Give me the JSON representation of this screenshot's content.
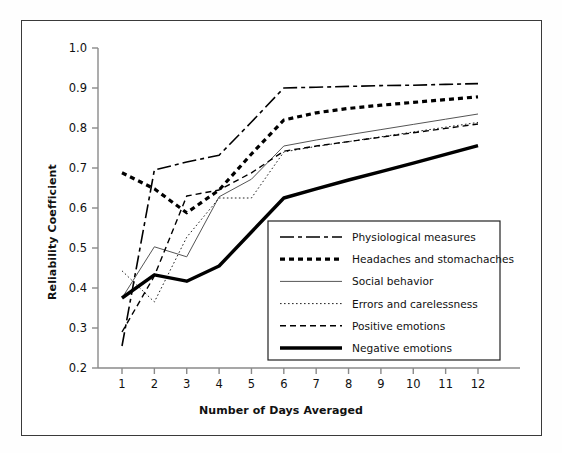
{
  "chart_data": {
    "type": "line",
    "title": "",
    "xlabel": "Number of Days Averaged",
    "ylabel": "Reliability Coefficient",
    "x": [
      1,
      2,
      3,
      4,
      5,
      6,
      7,
      8,
      9,
      10,
      11,
      12
    ],
    "xlim": [
      0.7,
      12.6
    ],
    "ylim": [
      0.2,
      1.0
    ],
    "xticks": [
      "1",
      "2",
      "3",
      "4",
      "5",
      "6",
      "7",
      "8",
      "9",
      "10",
      "11",
      "12"
    ],
    "yticks": [
      "0.2",
      "0.3",
      "0.4",
      "0.5",
      "0.6",
      "0.7",
      "0.8",
      "0.9",
      "1.0"
    ],
    "grid": false,
    "legend_position": "lower right",
    "series": [
      {
        "name": "Physiological measures",
        "style": "dash-dot",
        "width": 1.6,
        "color": "#000000",
        "values": [
          0.255,
          0.695,
          0.715,
          0.732,
          0.815,
          0.9,
          0.902,
          0.904,
          0.906,
          0.907,
          0.909,
          0.911
        ]
      },
      {
        "name": "Headaches and stomachaches",
        "style": "thick-dotted",
        "width": 3.2,
        "color": "#000000",
        "values": [
          0.688,
          0.648,
          0.588,
          0.645,
          0.735,
          0.82,
          0.838,
          0.849,
          0.857,
          0.864,
          0.871,
          0.878
        ]
      },
      {
        "name": "Social behavior",
        "style": "solid-thin",
        "width": 1.0,
        "color": "#555555",
        "values": [
          0.375,
          0.503,
          0.478,
          0.628,
          0.672,
          0.755,
          0.77,
          0.783,
          0.796,
          0.809,
          0.822,
          0.835
        ]
      },
      {
        "name": "Errors and carelessness",
        "style": "fine-dotted",
        "width": 1.0,
        "color": "#222222",
        "values": [
          0.443,
          0.365,
          0.527,
          0.625,
          0.625,
          0.74,
          0.754,
          0.766,
          0.778,
          0.79,
          0.802,
          0.814
        ]
      },
      {
        "name": "Positive emotions",
        "style": "dashed",
        "width": 1.4,
        "color": "#000000",
        "values": [
          0.29,
          0.43,
          0.63,
          0.645,
          0.688,
          0.742,
          0.755,
          0.766,
          0.777,
          0.788,
          0.799,
          0.81
        ]
      },
      {
        "name": "Negative emotions",
        "style": "solid-thick",
        "width": 3.4,
        "color": "#000000",
        "values": [
          0.375,
          0.433,
          0.417,
          0.455,
          0.54,
          0.625,
          0.648,
          0.67,
          0.691,
          0.712,
          0.734,
          0.756
        ]
      }
    ]
  },
  "axes": {
    "x_label": "Number of Days Averaged",
    "y_label": "Reliability Coefficient"
  },
  "legend": {
    "entries": [
      {
        "label": "Physiological measures"
      },
      {
        "label": "Headaches and stomachaches"
      },
      {
        "label": "Social behavior"
      },
      {
        "label": "Errors and carelessness"
      },
      {
        "label": "Positive emotions"
      },
      {
        "label": "Negative emotions"
      }
    ]
  },
  "colors": {
    "frame": "#3a3a3a",
    "axis": "#8a8a8a",
    "ink": "#111111",
    "background": "#ffffff"
  }
}
